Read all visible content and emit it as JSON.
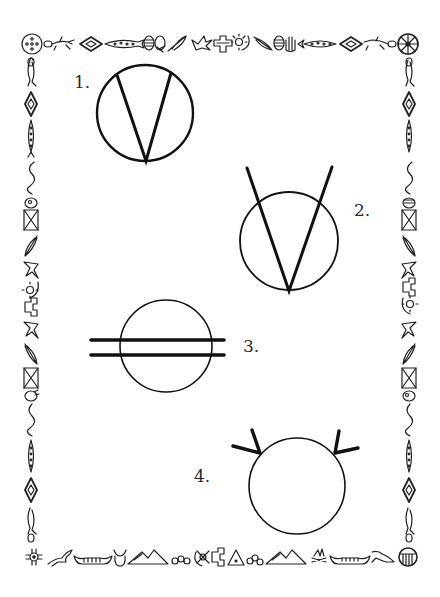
{
  "page": {
    "background": "#ffffff",
    "ink": "#111111"
  },
  "figures": [
    {
      "id": 1,
      "label": "1.",
      "description": "Circle with a V inscribed; both lines meet at the bottom of the circle and end on the circle edge"
    },
    {
      "id": 2,
      "label": "2.",
      "description": "Circle with a large V whose arms extend beyond the top of the circle; vertex at bottom of circle"
    },
    {
      "id": 3,
      "label": "3.",
      "description": "Circle crossed by two parallel thick horizontal lines extending beyond both sides"
    },
    {
      "id": 4,
      "label": "4.",
      "description": "Circle with a pair of short spikes at the upper left and upper right"
    }
  ],
  "border": {
    "style": "Native American pictograph motif frame",
    "top_icons": [
      "medicine-wheel-dots",
      "lizard",
      "diamond",
      "dotted-fish",
      "striped-egg",
      "shield-beaded",
      "feather",
      "bird",
      "thunderbird",
      "sun-moon",
      "feather",
      "striped-egg",
      "hand",
      "dotted-fish",
      "diamond",
      "lizard",
      "medicine-wheel-spokes"
    ],
    "bottom_icons": [
      "zia-sun",
      "running-horse",
      "canoe",
      "buffalo-head",
      "mountains",
      "rocks",
      "sun-moon",
      "thunderbird",
      "tipi",
      "rocks",
      "mountains",
      "campfire",
      "canoe",
      "running-horse",
      "striped-shield"
    ],
    "left_icons": [
      "lizard",
      "diamond",
      "dotted-fish",
      "snake",
      "hand-fish",
      "hourglass-pattern",
      "feather",
      "bird",
      "sun-moon",
      "thunderbird",
      "bird",
      "feather",
      "hourglass-pattern",
      "hand",
      "snake",
      "dotted-fish",
      "diamond",
      "lizard"
    ],
    "right_icons": [
      "lizard",
      "diamond",
      "dotted-fish",
      "snake",
      "hand",
      "hourglass-pattern",
      "feather",
      "bird",
      "thunderbird",
      "sun-moon",
      "bird",
      "feather",
      "hourglass-pattern",
      "fish",
      "snake",
      "dotted-fish",
      "diamond",
      "lizard"
    ]
  }
}
